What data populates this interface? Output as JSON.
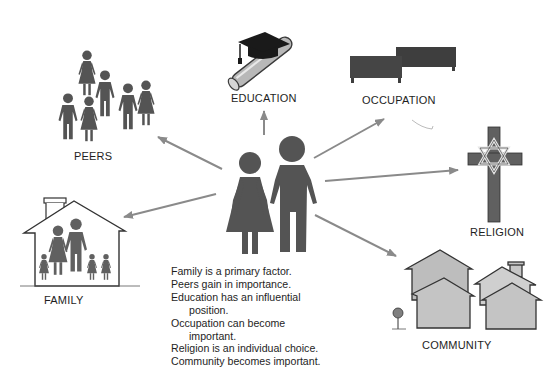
{
  "diagram": {
    "center": {
      "icon": "couple-icon",
      "description": "Adult man and woman figures"
    },
    "nodes": [
      {
        "id": "peers",
        "label": "PEERS",
        "icon": "group-of-people-icon"
      },
      {
        "id": "education",
        "label": "EDUCATION",
        "icon": "diploma-graduation-cap-icon"
      },
      {
        "id": "occupation",
        "label": "OCCUPATION",
        "icon": "desks-icon"
      },
      {
        "id": "religion",
        "label": "RELIGION",
        "icon": "cross-star-of-david-icon"
      },
      {
        "id": "family",
        "label": "FAMILY",
        "icon": "house-with-family-icon"
      },
      {
        "id": "community",
        "label": "COMMUNITY",
        "icon": "houses-icon"
      }
    ],
    "notes": [
      {
        "text": "Family is a primary factor.",
        "indent": false
      },
      {
        "text": "Peers gain in importance.",
        "indent": false
      },
      {
        "text": "Education has an influential",
        "indent": false
      },
      {
        "text": "position.",
        "indent": true
      },
      {
        "text": "Occupation can become",
        "indent": false
      },
      {
        "text": "important.",
        "indent": true
      },
      {
        "text": "Religion is an individual choice.",
        "indent": false
      },
      {
        "text": "Community becomes important.",
        "indent": false
      }
    ],
    "colors": {
      "figure": "#545454",
      "arrow": "#8a8a8a",
      "house_fill": "#c8c8c8",
      "desk": "#3e3e3e",
      "cross": "#606060",
      "text": "#1e1e1e"
    }
  }
}
